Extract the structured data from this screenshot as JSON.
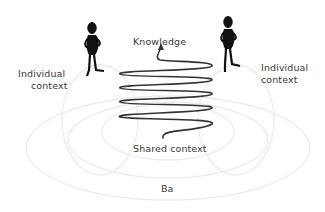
{
  "diagram": {
    "labels": {
      "knowledge": "Knowledge",
      "individual_left_line1": "Individual",
      "individual_left_line2": "context",
      "individual_right_line1": "Individual",
      "individual_right_line2": "context",
      "shared": "Shared context",
      "ba": "Ba"
    },
    "colors": {
      "text": "#3a3a3a",
      "spiral": "#333333",
      "figure": "#111111",
      "ellipses": "#eeeeee"
    },
    "elements": [
      "person-figure-left",
      "person-figure-right",
      "knowledge-spiral",
      "ba-ellipses"
    ]
  }
}
